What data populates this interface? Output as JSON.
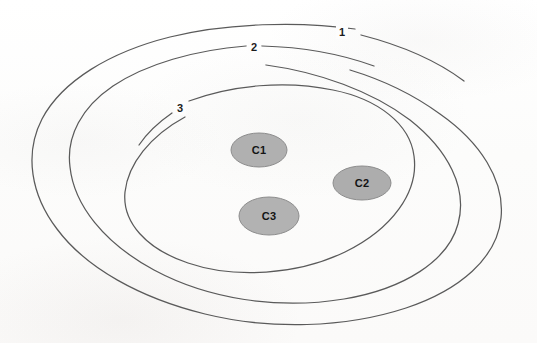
{
  "figure": {
    "type": "nested-ellipse-diagram",
    "background_color": "#fdfdfd",
    "outline_color": "#5a5a5a",
    "cluster_fill_color": "#b0b0b0",
    "cluster_stroke_color": "#8d8d8d",
    "label_color": "#1c1c1c"
  },
  "rings": [
    {
      "label": "1",
      "role": "outermost-ellipse",
      "label_x": 342,
      "label_y": 33,
      "cx": 268,
      "cy": 175,
      "rx": 233,
      "ry": 148
    },
    {
      "label": "2",
      "role": "middle-ellipse",
      "label_x": 254,
      "label_y": 48,
      "cx": 269,
      "cy": 174,
      "rx": 191,
      "ry": 128
    },
    {
      "label": "3",
      "role": "innermost-ellipse",
      "label_x": 180,
      "label_y": 109,
      "cx": 272,
      "cy": 177,
      "rx": 142,
      "ry": 96
    }
  ],
  "clusters": [
    {
      "label": "C1",
      "cx": 259,
      "cy": 150,
      "rx": 28,
      "ry": 17
    },
    {
      "label": "C2",
      "cx": 362,
      "cy": 183,
      "rx": 29,
      "ry": 17
    },
    {
      "label": "C3",
      "cx": 269,
      "cy": 216,
      "rx": 30,
      "ry": 19
    }
  ]
}
